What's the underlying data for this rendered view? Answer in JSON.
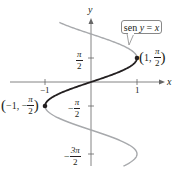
{
  "chart_data": {
    "type": "line",
    "title": "",
    "equation_label": "sen y = x",
    "xlabel": "x",
    "ylabel": "y",
    "x_ticks": [
      {
        "value": -1,
        "label": "-1"
      },
      {
        "value": 1,
        "label": "1"
      }
    ],
    "y_ticks": [
      {
        "value": 1.5708,
        "label": "π/2"
      },
      {
        "value": -1.5708,
        "label": "-π/2"
      },
      {
        "value": -4.7124,
        "label": "-3π/2"
      }
    ],
    "series": [
      {
        "name": "x = sin y (restricted, -π/2 ≤ y ≤ π/2)",
        "color": "#231f20",
        "relation": "x = sin(y)",
        "y_range": [
          -1.5708,
          1.5708
        ],
        "points": [
          [
            -1,
            -1.5708
          ],
          [
            -0.707,
            -0.785
          ],
          [
            0,
            0
          ],
          [
            0.707,
            0.785
          ],
          [
            1,
            1.5708
          ]
        ]
      },
      {
        "name": "x = sin y (remaining branches)",
        "color": "#a7a9ac",
        "relation": "x = sin(y)",
        "y_range": [
          -5.5,
          3.9
        ],
        "points": [
          [
            -0.69,
            3.9
          ],
          [
            0,
            3.1416
          ],
          [
            1,
            1.5708
          ],
          [
            -1,
            -1.5708
          ],
          [
            0,
            -3.1416
          ],
          [
            1,
            -4.7124
          ],
          [
            0.71,
            -5.5
          ]
        ]
      }
    ],
    "highlighted_points": [
      {
        "x": 1,
        "y": 1.5708,
        "label_x": "1",
        "label_y_num": "π",
        "label_y_den": "2"
      },
      {
        "x": -1,
        "y": -1.5708,
        "label_x": "−1",
        "label_y_sign": "−",
        "label_y_num": "π",
        "label_y_den": "2"
      }
    ],
    "xlim": [
      -1.9,
      1.8
    ],
    "ylim": [
      -5.6,
      4.0
    ],
    "grid": false,
    "legend": "none"
  },
  "labels": {
    "x_axis": "x",
    "y_axis": "y",
    "x_tick_neg1": "−1",
    "x_tick_1": "1",
    "y_tick_pi2_num": "π",
    "y_tick_pi2_den": "2",
    "y_tick_negpi2_sign": "−",
    "y_tick_negpi2_num": "π",
    "y_tick_negpi2_den": "2",
    "y_tick_neg3pi2_sign": "−",
    "y_tick_neg3pi2_num": "3π",
    "y_tick_neg3pi2_den": "2",
    "callout_text_fn": "sen",
    "callout_text_var": "y",
    "callout_text_eq": " = ",
    "callout_text_x": "x",
    "pt1_open": "(",
    "pt1_x": "1, ",
    "pt1_num": "π",
    "pt1_den": "2",
    "pt1_close": ")",
    "pt2_open": "(",
    "pt2_x": "−1, −",
    "pt2_num": "π",
    "pt2_den": "2",
    "pt2_close": ")"
  },
  "colors": {
    "main_curve": "#231f20",
    "other_curve": "#a7a9ac",
    "axis": "#555555"
  }
}
